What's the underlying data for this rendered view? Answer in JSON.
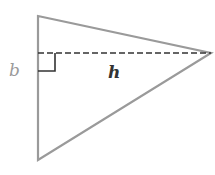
{
  "diagram": {
    "type": "triangle-base-height",
    "labels": {
      "base": "b",
      "height": "h"
    },
    "colors": {
      "outline": "#9a9a9a",
      "dashed": "#333333",
      "right_angle": "#333333",
      "base_label": "#9a9a9a",
      "height_label": "#333333"
    }
  }
}
